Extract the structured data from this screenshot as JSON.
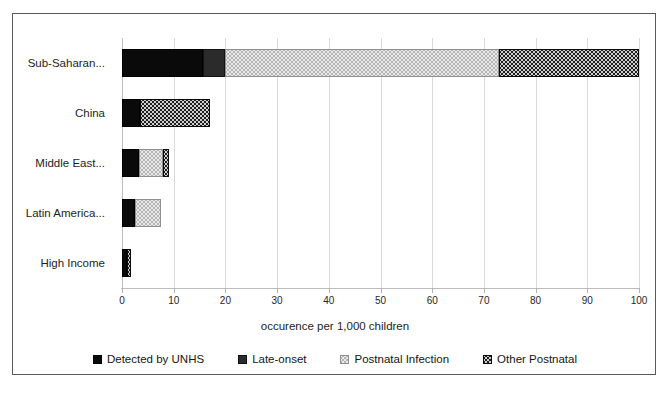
{
  "chart_data": {
    "type": "bar",
    "orientation": "horizontal",
    "stacked": true,
    "title": "",
    "xlabel": "occurence per 1,000 children",
    "ylabel": "",
    "xlim": [
      0,
      100
    ],
    "xticks": [
      0,
      10,
      20,
      30,
      40,
      50,
      60,
      70,
      80,
      90,
      100
    ],
    "xtick_labels": [
      "0",
      "10",
      "20",
      "30",
      "40",
      "50",
      "60",
      "70",
      "80",
      "90",
      "100"
    ],
    "grid": true,
    "legend_position": "bottom",
    "categories": [
      "Sub-Saharan...",
      "China",
      "Middle East...",
      "Latin America...",
      "High Income"
    ],
    "series": [
      {
        "name": "Detected by UNHS",
        "color": "#0a0a0a",
        "pattern": "solid-black",
        "values": [
          15.7,
          3.4,
          3.3,
          2.5,
          1.0
        ]
      },
      {
        "name": "Late-onset",
        "color": "#2b2b2b",
        "pattern": "solid-dark-gray",
        "values": [
          4.3,
          0,
          0,
          0,
          0
        ]
      },
      {
        "name": "Postnatal Infection",
        "color": "#b5b5b5",
        "pattern": "dotted-light-gray",
        "values": [
          53.0,
          0,
          4.7,
          5.0,
          0
        ]
      },
      {
        "name": "Other Postnatal",
        "color": "#1f1f1f",
        "pattern": "dotted-dark",
        "values": [
          27.0,
          13.6,
          1.0,
          0,
          0.8
        ]
      }
    ],
    "totals": [
      100.0,
      17.0,
      9.0,
      7.5,
      1.8
    ]
  },
  "legend": {
    "items": [
      {
        "label": "Detected by UNHS",
        "swatch": "legend-swatch-detected-by-unhs"
      },
      {
        "label": "Late-onset",
        "swatch": "legend-swatch-late-onset"
      },
      {
        "label": "Postnatal Infection",
        "swatch": "legend-swatch-postnatal-infection"
      },
      {
        "label": "Other Postnatal",
        "swatch": "legend-swatch-other-postnatal"
      }
    ]
  },
  "axis": {
    "x_title": "occurence per 1,000 children"
  }
}
